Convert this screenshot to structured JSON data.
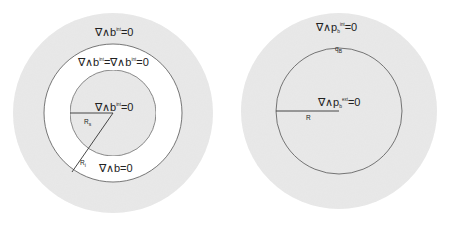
{
  "colors": {
    "background": "#ffffff",
    "field_fill": "#e6e6e6",
    "ring_fill": "#ffffff",
    "stroke": "#555555",
    "text": "#222222"
  },
  "left_figure": {
    "outer_region_label": {
      "lhs": "∇∧b",
      "sup": "int",
      "rhs": "=0"
    },
    "ring_region_label": {
      "lhs1": "∇∧b",
      "sup1": "int",
      "eq": "=∇∧b",
      "sup2": "int",
      "rhs": "=0"
    },
    "inner_region_label": {
      "lhs": "∇∧b",
      "sup": "int",
      "rhs": "=0"
    },
    "ring_bottom_label": "∇∧b=0",
    "inner_radius_label": {
      "main": "R",
      "sub": "s"
    },
    "outer_radius_label": {
      "main": "R",
      "sub": "i"
    }
  },
  "right_figure": {
    "outer_region_label": {
      "lhs": "∇∧p",
      "sub": "b",
      "sup": "int",
      "rhs": "=0"
    },
    "boundary_label": {
      "main": "q",
      "sub": "B"
    },
    "inner_region_label": {
      "lhs": "∇∧p",
      "sub": "b",
      "sup": "ext",
      "rhs": "=0"
    },
    "radius_label": "R"
  }
}
